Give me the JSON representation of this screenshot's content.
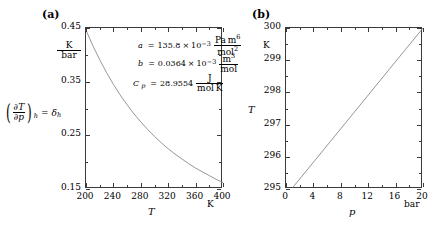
{
  "figure": {
    "panel_a": {
      "label": "(a)",
      "yaxis": {
        "unit_num": "K",
        "unit_den": "bar",
        "ticks": [
          "0.45",
          "0.35",
          "0.25",
          "0.15"
        ],
        "tick_values": [
          0.45,
          0.35,
          0.25,
          0.15
        ],
        "lim": [
          0.15,
          0.45
        ],
        "quantity_num": "∂T",
        "quantity_den": "∂p",
        "quantity_sub": "h",
        "quantity_eq": "=",
        "quantity_sym": "δ",
        "quantity_sym_sub": "h"
      },
      "xaxis": {
        "title": "T",
        "unit": "K",
        "ticks": [
          "200",
          "240",
          "280",
          "320",
          "360",
          "400"
        ],
        "tick_values": [
          200,
          240,
          280,
          320,
          360,
          400
        ],
        "lim": [
          200,
          400
        ]
      },
      "annotations": [
        {
          "symbol": "a",
          "eq": "=",
          "value": "135.8",
          "times": "×",
          "base": "10",
          "exp": "−3",
          "unit_num": "Pa m",
          "unit_num_sup": "6",
          "unit_den": "mol",
          "unit_den_sup": "2"
        },
        {
          "symbol": "b",
          "eq": "=",
          "value": "0.0364",
          "times": "×",
          "base": "10",
          "exp": "−3",
          "unit_num": "m",
          "unit_num_sup": "3",
          "unit_den": "mol",
          "unit_den_sup": ""
        },
        {
          "symbol": "C",
          "symbol_sub": "p",
          "eq": "=",
          "value": "28.9554",
          "times": "",
          "base": "",
          "exp": "",
          "unit_num": "J",
          "unit_num_sup": "",
          "unit_den": "mol K",
          "unit_den_sup": ""
        }
      ]
    },
    "panel_b": {
      "label": "(b)",
      "yaxis": {
        "unit": "K",
        "title": "T",
        "ticks": [
          "300",
          "299",
          "298",
          "297",
          "296",
          "295"
        ],
        "tick_values": [
          300,
          299,
          298,
          297,
          296,
          295
        ],
        "lim": [
          295,
          300
        ]
      },
      "xaxis": {
        "title": "p",
        "unit": "bar",
        "ticks": [
          "0",
          "4",
          "8",
          "12",
          "16",
          "20"
        ],
        "tick_values": [
          0,
          4,
          8,
          12,
          16,
          20
        ],
        "lim": [
          0,
          20
        ]
      }
    }
  },
  "chart_data": [
    {
      "type": "line",
      "title": "(a)",
      "xlabel": "T",
      "ylabel": "(∂T/∂p)_h = δ_h",
      "xunit": "K",
      "yunit": "K/bar",
      "xlim": [
        200,
        400
      ],
      "ylim": [
        0.15,
        0.45
      ],
      "grid": false,
      "legend": "none",
      "x": [
        200,
        210,
        220,
        230,
        240,
        250,
        260,
        270,
        280,
        290,
        300,
        310,
        320,
        330,
        340,
        350,
        360,
        370,
        380,
        390,
        400
      ],
      "y": [
        0.446,
        0.417,
        0.391,
        0.367,
        0.345,
        0.325,
        0.307,
        0.29,
        0.275,
        0.261,
        0.248,
        0.236,
        0.225,
        0.215,
        0.206,
        0.197,
        0.189,
        0.182,
        0.175,
        0.168,
        0.162
      ]
    },
    {
      "type": "line",
      "title": "(b)",
      "xlabel": "p",
      "ylabel": "T",
      "xunit": "bar",
      "yunit": "K",
      "xlim": [
        0,
        20
      ],
      "ylim": [
        295,
        300
      ],
      "grid": false,
      "legend": "none",
      "x": [
        1,
        20
      ],
      "y": [
        295.05,
        300.0
      ]
    }
  ]
}
